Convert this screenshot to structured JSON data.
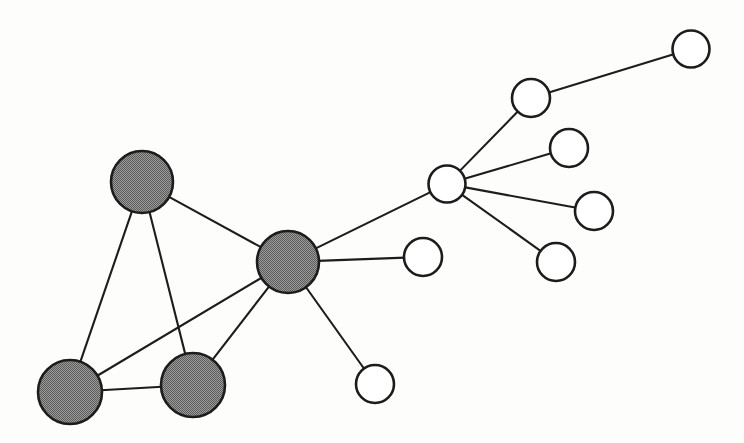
{
  "figure": {
    "background_color": "#fdfdfc",
    "width": 744,
    "height": 443
  },
  "style": {
    "filled_node_fill": "#808080",
    "hollow_node_fill": "#ffffff",
    "node_stroke_color": "#1c1c1c",
    "node_stroke_width": 2.6,
    "edge_stroke_color": "#1d1d1d",
    "edge_stroke_width": 2.1
  },
  "chart_data": {
    "type": "diagram",
    "subtype": "node-link-graph",
    "title": "",
    "xlabel": "",
    "ylabel": "",
    "grid": false,
    "legend": "none",
    "directed": false,
    "node_count": 13,
    "edge_count": 15,
    "node_classes": [
      {
        "name": "filled",
        "fill": "#808080",
        "count": 4,
        "label": "shaded node"
      },
      {
        "name": "hollow",
        "fill": "#ffffff",
        "count": 9,
        "label": "open node"
      }
    ],
    "nodes": [
      {
        "id": "g1",
        "class": "filled",
        "cx": 142,
        "cy": 182,
        "r": 31,
        "degree": 3
      },
      {
        "id": "g2",
        "class": "filled",
        "cx": 288,
        "cy": 262,
        "r": 31,
        "degree": 6
      },
      {
        "id": "g3",
        "class": "filled",
        "cx": 70,
        "cy": 392,
        "r": 32,
        "degree": 3
      },
      {
        "id": "g4",
        "class": "filled",
        "cx": 193,
        "cy": 385,
        "r": 32,
        "degree": 3
      },
      {
        "id": "h1",
        "class": "hollow",
        "cx": 447,
        "cy": 184,
        "r": 18.5,
        "degree": 5
      },
      {
        "id": "h2",
        "class": "hollow",
        "cx": 531,
        "cy": 98,
        "r": 19,
        "degree": 2
      },
      {
        "id": "h3",
        "class": "hollow",
        "cx": 691,
        "cy": 49,
        "r": 18.5,
        "degree": 1
      },
      {
        "id": "h4",
        "class": "hollow",
        "cx": 569,
        "cy": 148,
        "r": 19,
        "degree": 1
      },
      {
        "id": "h5",
        "class": "hollow",
        "cx": 594,
        "cy": 211,
        "r": 19,
        "degree": 1
      },
      {
        "id": "h6",
        "class": "hollow",
        "cx": 556,
        "cy": 262,
        "r": 19,
        "degree": 1
      },
      {
        "id": "h7",
        "class": "hollow",
        "cx": 423,
        "cy": 257,
        "r": 19,
        "degree": 1
      },
      {
        "id": "h8",
        "class": "hollow",
        "cx": 375,
        "cy": 384,
        "r": 19,
        "degree": 1
      }
    ],
    "edges": [
      {
        "source": "g1",
        "target": "g2"
      },
      {
        "source": "g1",
        "target": "g3"
      },
      {
        "source": "g1",
        "target": "g4"
      },
      {
        "source": "g2",
        "target": "g3"
      },
      {
        "source": "g2",
        "target": "g4"
      },
      {
        "source": "g3",
        "target": "g4"
      },
      {
        "source": "g2",
        "target": "h1"
      },
      {
        "source": "g2",
        "target": "h7"
      },
      {
        "source": "g2",
        "target": "h8"
      },
      {
        "source": "h1",
        "target": "h2"
      },
      {
        "source": "h1",
        "target": "h4"
      },
      {
        "source": "h1",
        "target": "h5"
      },
      {
        "source": "h1",
        "target": "h6"
      },
      {
        "source": "h2",
        "target": "h3"
      }
    ]
  }
}
